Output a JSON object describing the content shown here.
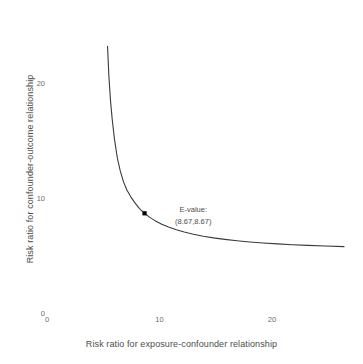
{
  "chart_data": {
    "type": "line",
    "title": "",
    "subtitle": "",
    "xlabel": "Risk ratio for exposure-confounder relationship",
    "ylabel": "Risk ratio for confounder-outcome relationship",
    "xlim": [
      0,
      26.8
    ],
    "ylim": [
      0,
      24.5
    ],
    "xticks": [
      0,
      10,
      20
    ],
    "xtick_labels": [
      "0",
      "10",
      "20"
    ],
    "yticks": [
      0,
      10,
      20
    ],
    "ytick_labels": [
      "0",
      "10",
      "20"
    ],
    "grid": false,
    "legend": "none",
    "line_color": "#3a3a3a",
    "point_color": "#000000",
    "background_color": "#ffffff",
    "series": [
      {
        "name": "bias-factor-curve",
        "x": [
          5.38,
          5.5,
          5.65,
          5.8,
          6.0,
          6.25,
          6.5,
          6.8,
          7.1,
          7.45,
          7.8,
          8.2,
          8.67,
          9.1,
          9.6,
          10.2,
          10.8,
          11.5,
          12.2,
          13.0,
          13.9,
          14.8,
          15.8,
          16.9,
          18.0,
          19.2,
          20.5,
          21.8,
          23.2,
          24.7,
          26.4
        ],
        "y": [
          23.2,
          20.6,
          18.4,
          16.8,
          15.1,
          13.5,
          12.4,
          11.4,
          10.7,
          10.1,
          9.6,
          9.1,
          8.67,
          8.34,
          8.03,
          7.72,
          7.48,
          7.24,
          7.04,
          6.85,
          6.67,
          6.53,
          6.4,
          6.28,
          6.18,
          6.09,
          6.01,
          5.94,
          5.88,
          5.82,
          5.77
        ]
      }
    ],
    "points": [
      {
        "name": "e-value-point",
        "x": 8.67,
        "y": 8.67
      }
    ],
    "annotations": [
      {
        "name": "e-value-annotation",
        "line1": "E-value:",
        "line2": "(8.67,8.67)",
        "x": 13.0,
        "y": 9.4
      }
    ]
  }
}
